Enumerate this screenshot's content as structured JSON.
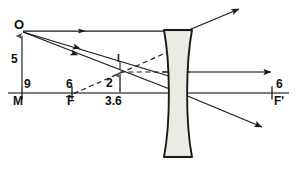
{
  "diagram": {
    "background_color": "#ffffff",
    "ink_color": "#1a1a1a",
    "lens_fill_color": "#ebebe6",
    "labels": {
      "object_point": "O",
      "object_height": "5",
      "object_distance": "9",
      "focal_left_value": "6",
      "focal_left_point": "M",
      "focal_point_left": "F",
      "image_marker": "I",
      "image_height": "2",
      "image_distance": "3.6",
      "focal_right_value": "6",
      "focal_point_right": "F'"
    },
    "elements": {
      "lens_type": "biconcave",
      "axis_label": "principal-axis",
      "rays": [
        "parallel-ray-from-object",
        "ray-through-optical-center",
        "ray-toward-far-focus",
        "refracted-ray-upper",
        "refracted-ray-axis",
        "refracted-ray-lower"
      ],
      "virtual_rays": [
        "virtual-ray-from-focus",
        "virtual-ray-horizontal"
      ]
    },
    "geometry": {
      "axis_y": 93,
      "object_x": 22,
      "object_top_y": 31,
      "lens_center_x": 178,
      "image_x": 120,
      "image_top_y": 71,
      "focus_left_x": 72,
      "focus_right_x": 272
    }
  }
}
